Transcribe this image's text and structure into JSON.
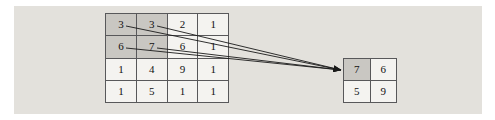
{
  "figure": {
    "background_color": "#e3e1dc",
    "grid_line_color": "#58585a",
    "cell_color": "#f4f3f0",
    "highlight_color": "#c9c7c2",
    "arrow_color": "#1a1a1a"
  },
  "input_matrix": {
    "name": "input-feature-map",
    "rows": 4,
    "cols": 4,
    "values": [
      [
        "3",
        "3",
        "2",
        "1"
      ],
      [
        "6",
        "7",
        "6",
        "1"
      ],
      [
        "1",
        "4",
        "9",
        "1"
      ],
      [
        "1",
        "5",
        "1",
        "1"
      ]
    ],
    "highlighted_cells": [
      [
        0,
        0
      ],
      [
        0,
        1
      ],
      [
        1,
        0
      ],
      [
        1,
        1
      ]
    ]
  },
  "output_matrix": {
    "name": "pooled-output",
    "rows": 2,
    "cols": 2,
    "values": [
      [
        "7",
        "6"
      ],
      [
        "5",
        "9"
      ]
    ],
    "highlighted_cells": [
      [
        0,
        0
      ]
    ]
  },
  "arrows": {
    "count": 4,
    "from_cells": [
      "3",
      "3",
      "6",
      "7"
    ],
    "to_cell": "7"
  }
}
